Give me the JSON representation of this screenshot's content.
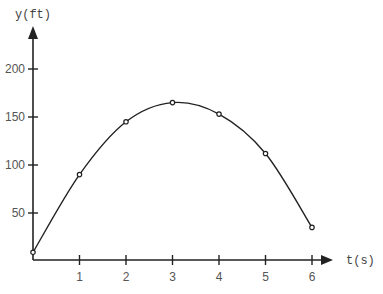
{
  "chart_data": {
    "type": "line",
    "title": "",
    "xlabel": "t(s)",
    "ylabel": "y(ft)",
    "x": [
      0,
      1,
      2,
      3,
      4,
      5,
      6
    ],
    "series": [
      {
        "name": "height",
        "values": [
          9,
          90,
          145,
          165,
          153,
          112,
          35
        ]
      }
    ],
    "x_ticks": [
      1,
      2,
      3,
      4,
      5,
      6
    ],
    "y_ticks": [
      50,
      100,
      150,
      200
    ],
    "xlim": [
      0,
      6.4
    ],
    "ylim": [
      0,
      240
    ],
    "grid": false,
    "legend": "none",
    "markers": "open-circle",
    "curve": "smooth"
  },
  "colors": {
    "line": "#222222",
    "axis": "#222222",
    "text": "#555555"
  }
}
